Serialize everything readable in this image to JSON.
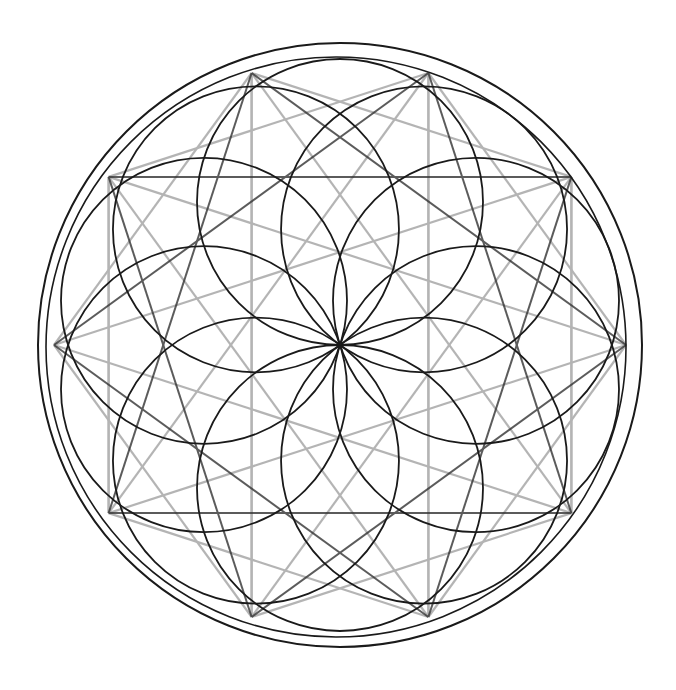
{
  "figure": {
    "title": "",
    "center": [
      340,
      345
    ],
    "outer_circle_radius": 302,
    "inner_guide_radius": 286,
    "petal_circle_count": 10,
    "petal_circle_radius": 143,
    "petal_ring_radius": 143,
    "star_points": 10,
    "colors": {
      "ink": "#1a1a1a",
      "graphite": "#9a9a9a",
      "paper": "#ffffff"
    }
  }
}
